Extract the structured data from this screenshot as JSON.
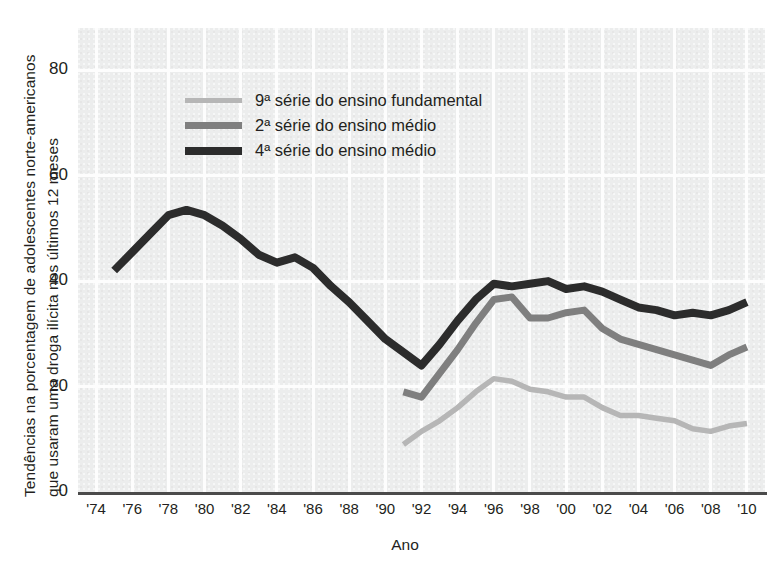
{
  "chart_data": {
    "type": "line",
    "title": "",
    "xlabel": "Ano",
    "ylabel": "Tendências na porcentagem de adolescentes norte-americanos que usaram uma droga ilícita nos últimos 12 meses",
    "ylabel_line1": "Tendências na porcentagem de adolescentes norte-americanos",
    "ylabel_line2": "que usaram uma droga ilícita nos últimos 12 meses",
    "xlim": [
      1973,
      2011
    ],
    "ylim": [
      0,
      88
    ],
    "yticks": [
      0,
      20,
      40,
      60,
      80
    ],
    "ytick_labels": [
      "0",
      "20",
      "40",
      "60",
      "80"
    ],
    "xticks": [
      1974,
      1976,
      1978,
      1980,
      1982,
      1984,
      1986,
      1988,
      1990,
      1992,
      1994,
      1996,
      1998,
      2000,
      2002,
      2004,
      2006,
      2008,
      2010
    ],
    "xtick_labels": [
      "'74",
      "'76",
      "'78",
      "'80",
      "'82",
      "'84",
      "'86",
      "'88",
      "'90",
      "'92",
      "'94",
      "'96",
      "'98",
      "'00",
      "'02",
      "'04",
      "'06",
      "'08",
      "'10"
    ],
    "grid": "vertical-and-horizontal-white",
    "legend_position": "upper-center-left",
    "series": [
      {
        "name": "9ª série do ensino fundamental",
        "color": "#b6b6b6",
        "x": [
          1991,
          1992,
          1993,
          1994,
          1995,
          1996,
          1997,
          1998,
          1999,
          2000,
          2001,
          2002,
          2003,
          2004,
          2005,
          2006,
          2007,
          2008,
          2009,
          2010
        ],
        "values": [
          9.0,
          11.5,
          13.5,
          16.0,
          19.0,
          21.5,
          21.0,
          19.5,
          19.0,
          18.0,
          18.0,
          16.0,
          14.5,
          14.5,
          14.0,
          13.5,
          12.0,
          11.5,
          12.5,
          13.0
        ]
      },
      {
        "name": "2ª série do ensino médio",
        "color": "#7f7f7f",
        "x": [
          1991,
          1992,
          1993,
          1994,
          1995,
          1996,
          1997,
          1998,
          1999,
          2000,
          2001,
          2002,
          2003,
          2004,
          2005,
          2006,
          2007,
          2008,
          2009,
          2010
        ],
        "values": [
          19.0,
          18.0,
          22.5,
          27.0,
          32.0,
          36.5,
          37.0,
          33.0,
          33.0,
          34.0,
          34.5,
          31.0,
          29.0,
          28.0,
          27.0,
          26.0,
          25.0,
          24.0,
          26.0,
          27.5
        ]
      },
      {
        "name": "4ª série do ensino médio",
        "color": "#2c2c2c",
        "x": [
          1975,
          1976,
          1977,
          1978,
          1979,
          1980,
          1981,
          1982,
          1983,
          1984,
          1985,
          1986,
          1987,
          1988,
          1989,
          1990,
          1991,
          1992,
          1993,
          1994,
          1995,
          1996,
          1997,
          1998,
          1999,
          2000,
          2001,
          2002,
          2003,
          2004,
          2005,
          2006,
          2007,
          2008,
          2009,
          2010
        ],
        "values": [
          42.0,
          45.5,
          49.0,
          52.5,
          53.5,
          52.5,
          50.5,
          48.0,
          45.0,
          43.5,
          44.5,
          42.5,
          39.0,
          36.0,
          32.5,
          29.0,
          26.5,
          24.0,
          28.0,
          32.5,
          36.5,
          39.5,
          39.0,
          39.5,
          40.0,
          38.5,
          39.0,
          38.0,
          36.5,
          35.0,
          34.5,
          33.5,
          34.0,
          33.5,
          34.5,
          36.0
        ]
      }
    ]
  },
  "legend": {
    "items": [
      {
        "label": "9ª série do ensino fundamental",
        "color": "#b6b6b6"
      },
      {
        "label": "2ª série do ensino médio",
        "color": "#7f7f7f"
      },
      {
        "label": "4ª série do ensino médio",
        "color": "#2c2c2c"
      }
    ]
  }
}
